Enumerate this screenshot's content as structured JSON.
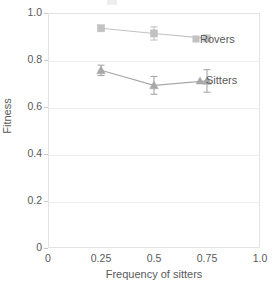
{
  "chart_data": {
    "type": "line",
    "title": "",
    "xlabel": "Frequency of sitters",
    "ylabel": "Fitness",
    "xlim": [
      0,
      1.0
    ],
    "ylim": [
      0,
      1.0
    ],
    "x": [
      0.25,
      0.5,
      0.75
    ],
    "xticks": [
      "0",
      "0.25",
      "0.5",
      "0.75",
      "1.0"
    ],
    "xtick_values": [
      0,
      0.25,
      0.5,
      0.75,
      1.0
    ],
    "yticks": [
      "0",
      "0.2",
      "0.4",
      "0.6",
      "0.8",
      "1.0"
    ],
    "ytick_values": [
      0,
      0.2,
      0.4,
      0.6,
      0.8,
      1.0
    ],
    "grid": "horizontal",
    "legend_position": "inline-right",
    "series": [
      {
        "name": "Rovers",
        "marker": "square",
        "color": "#c2c2c2",
        "values": [
          0.935,
          0.913,
          0.892
        ],
        "yerr": [
          0.008,
          0.028,
          0.004
        ]
      },
      {
        "name": "Sitters",
        "marker": "triangle",
        "color": "#a8a8a8",
        "values": [
          0.756,
          0.692,
          0.711
        ],
        "yerr": [
          0.022,
          0.038,
          0.048
        ]
      }
    ]
  },
  "axes": {
    "x_title": "Frequency of sitters",
    "y_title": "Fitness"
  },
  "legend": {
    "rovers_label": "Rovers",
    "sitters_label": "Sitters"
  },
  "colors": {
    "rovers": "#c2c2c2",
    "sitters": "#a8a8a8",
    "grid": "#ededed",
    "frame": "#e3e3e3",
    "text": "#58595b",
    "background": "#ffffff"
  }
}
